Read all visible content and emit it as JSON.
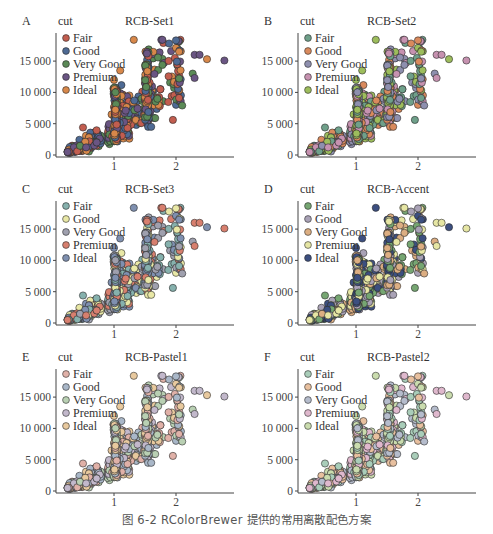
{
  "caption": "图 6-2   RColorBrewer 提供的常用离散配色方案",
  "legend_title": "cut",
  "legend_labels": [
    "Fair",
    "Good",
    "Very Good",
    "Premium",
    "Ideal"
  ],
  "y_ticks": [
    {
      "value": 0,
      "label": "0"
    },
    {
      "value": 5000,
      "label": "5 000"
    },
    {
      "value": 10000,
      "label": "10 000"
    },
    {
      "value": 15000,
      "label": "15 000"
    }
  ],
  "x_ticks": [
    {
      "value": 1,
      "label": "1"
    },
    {
      "value": 2,
      "label": "2"
    }
  ],
  "panels": [
    {
      "tag": "A",
      "title": "RCB-Set1",
      "palette": [
        "#c25d4f",
        "#4e6a94",
        "#5b8a57",
        "#6a5583",
        "#d8884a"
      ]
    },
    {
      "tag": "B",
      "title": "RCB-Set2",
      "palette": [
        "#6fa08a",
        "#d98a5d",
        "#8e8fae",
        "#c692b0",
        "#9dbd5c"
      ]
    },
    {
      "tag": "C",
      "title": "RCB-Set3",
      "palette": [
        "#86b1ad",
        "#e9e8a6",
        "#9fa0ae",
        "#d77f6e",
        "#7f90b0"
      ]
    },
    {
      "tag": "D",
      "title": "RCB-Accent",
      "palette": [
        "#76a672",
        "#a9a2b6",
        "#dcae82",
        "#e6e6a4",
        "#3c4f80"
      ]
    },
    {
      "tag": "E",
      "title": "RCB-Pastel1",
      "palette": [
        "#e0b1a8",
        "#a9b7c8",
        "#b9d0b3",
        "#c2b8cb",
        "#e8c99e"
      ]
    },
    {
      "tag": "F",
      "title": "RCB-Pastel2",
      "palette": [
        "#a9cdb9",
        "#e8c09f",
        "#b5bccc",
        "#dfb8cd",
        "#cadcae"
      ]
    }
  ],
  "chart_data": [
    {
      "type": "scatter",
      "title": "RCB-Set1",
      "panel": "A",
      "xlabel": "carat",
      "ylabel": "price",
      "xlim": [
        0.15,
        2.85
      ],
      "ylim": [
        0,
        19000
      ],
      "x_ticks": [
        1,
        2
      ],
      "y_ticks": [
        0,
        5000,
        10000,
        15000
      ],
      "legend": {
        "title": "cut",
        "entries": [
          "Fair",
          "Good",
          "Very Good",
          "Premium",
          "Ideal"
        ],
        "position": "top-left inside"
      },
      "colors": [
        "#c25d4f",
        "#4e6a94",
        "#5b8a57",
        "#6a5583",
        "#d8884a"
      ],
      "grid": false
    },
    {
      "type": "scatter",
      "title": "RCB-Set2",
      "panel": "B",
      "xlim": [
        0.15,
        2.85
      ],
      "ylim": [
        0,
        19000
      ],
      "x_ticks": [
        1,
        2
      ],
      "y_ticks": [
        0,
        5000,
        10000,
        15000
      ],
      "legend": {
        "title": "cut",
        "entries": [
          "Fair",
          "Good",
          "Very Good",
          "Premium",
          "Ideal"
        ]
      },
      "colors": [
        "#6fa08a",
        "#d98a5d",
        "#8e8fae",
        "#c692b0",
        "#9dbd5c"
      ],
      "grid": false
    },
    {
      "type": "scatter",
      "title": "RCB-Set3",
      "panel": "C",
      "xlim": [
        0.15,
        2.85
      ],
      "ylim": [
        0,
        19000
      ],
      "x_ticks": [
        1,
        2
      ],
      "y_ticks": [
        0,
        5000,
        10000,
        15000
      ],
      "legend": {
        "title": "cut",
        "entries": [
          "Fair",
          "Good",
          "Very Good",
          "Premium",
          "Ideal"
        ]
      },
      "colors": [
        "#86b1ad",
        "#e9e8a6",
        "#9fa0ae",
        "#d77f6e",
        "#7f90b0"
      ],
      "grid": false
    },
    {
      "type": "scatter",
      "title": "RCB-Accent",
      "panel": "D",
      "xlim": [
        0.15,
        2.85
      ],
      "ylim": [
        0,
        19000
      ],
      "x_ticks": [
        1,
        2
      ],
      "y_ticks": [
        0,
        5000,
        10000,
        15000
      ],
      "legend": {
        "title": "cut",
        "entries": [
          "Fair",
          "Good",
          "Very Good",
          "Premium",
          "Ideal"
        ]
      },
      "colors": [
        "#76a672",
        "#a9a2b6",
        "#dcae82",
        "#e6e6a4",
        "#3c4f80"
      ],
      "grid": false
    },
    {
      "type": "scatter",
      "title": "RCB-Pastel1",
      "panel": "E",
      "xlim": [
        0.15,
        2.85
      ],
      "ylim": [
        0,
        19000
      ],
      "x_ticks": [
        1,
        2
      ],
      "y_ticks": [
        0,
        5000,
        10000,
        15000
      ],
      "legend": {
        "title": "cut",
        "entries": [
          "Fair",
          "Good",
          "Very Good",
          "Premium",
          "Ideal"
        ]
      },
      "colors": [
        "#e0b1a8",
        "#a9b7c8",
        "#b9d0b3",
        "#c2b8cb",
        "#e8c99e"
      ],
      "grid": false
    },
    {
      "type": "scatter",
      "title": "RCB-Pastel2",
      "panel": "F",
      "xlim": [
        0.15,
        2.85
      ],
      "ylim": [
        0,
        19000
      ],
      "x_ticks": [
        1,
        2
      ],
      "y_ticks": [
        0,
        5000,
        10000,
        15000
      ],
      "legend": {
        "title": "cut",
        "entries": [
          "Fair",
          "Good",
          "Very Good",
          "Premium",
          "Ideal"
        ]
      },
      "colors": [
        "#a9cdb9",
        "#e8c09f",
        "#b5bccc",
        "#dfb8cd",
        "#cadcae"
      ],
      "grid": false
    }
  ]
}
